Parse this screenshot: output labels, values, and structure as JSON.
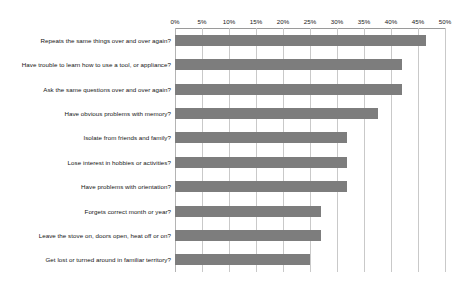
{
  "chart_data": {
    "type": "bar",
    "orientation": "horizontal",
    "title": "",
    "subtitle": "",
    "xlabel": "",
    "ylabel": "",
    "xlim": [
      0,
      50
    ],
    "xunit": "%",
    "grid": true,
    "legend": false,
    "axis_position": "top",
    "bar_color": "#7d7d7d",
    "gridline_color": "#c9c9c9",
    "xticks": [
      0,
      5,
      10,
      15,
      20,
      25,
      30,
      35,
      40,
      45,
      50
    ],
    "xtick_labels": [
      "0%",
      "5%",
      "10%",
      "15%",
      "20%",
      "25%",
      "30%",
      "35%",
      "40%",
      "45%",
      "50%"
    ],
    "categories": [
      "Repeats the same things over and over again?",
      "Have trouble to learn how to use a tool, or appliance?",
      "Ask the same questions over and over again?",
      "Have obvious problems with memory?",
      "Isolate from friends and family?",
      "Lose interest in hobbies or activities?",
      "Have problems with orientation?",
      "Forgets correct month or year?",
      "Leave the stove on, doors open, heat off or on?",
      "Get lost or turned around in familiar territory?"
    ],
    "values": [
      46.5,
      42.0,
      42.0,
      37.5,
      31.8,
      31.8,
      31.8,
      27.0,
      27.0,
      25.0
    ]
  }
}
